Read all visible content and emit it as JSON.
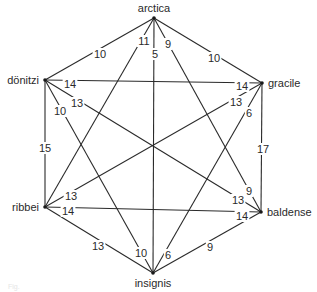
{
  "diagram": {
    "type": "complete-weighted-graph",
    "nodes": [
      {
        "id": "arctica",
        "label": "arctica",
        "x": 154,
        "y": 18,
        "lx": 154,
        "ly": 12,
        "anchor": "middle"
      },
      {
        "id": "gracile",
        "label": "gracile",
        "x": 262,
        "y": 83,
        "lx": 268,
        "ly": 87,
        "anchor": "start"
      },
      {
        "id": "baldense",
        "label": "baldense",
        "x": 261,
        "y": 212,
        "lx": 267,
        "ly": 216,
        "anchor": "start"
      },
      {
        "id": "insignis",
        "label": "insignis",
        "x": 153,
        "y": 273,
        "lx": 153,
        "ly": 287,
        "anchor": "middle"
      },
      {
        "id": "ribbei",
        "label": "ribbei",
        "x": 45,
        "y": 207,
        "lx": 39,
        "ly": 211,
        "anchor": "end"
      },
      {
        "id": "donitzi",
        "label": "dönitzi",
        "x": 45,
        "y": 80,
        "lx": 39,
        "ly": 84,
        "anchor": "end"
      }
    ],
    "edges": [
      {
        "from": "arctica",
        "to": "donitzi",
        "weight": "10",
        "lx": 100,
        "ly": 54
      },
      {
        "from": "arctica",
        "to": "gracile",
        "weight": "10",
        "lx": 214,
        "ly": 58
      },
      {
        "from": "arctica",
        "to": "ribbei",
        "weight": "11",
        "lx": 144,
        "ly": 41
      },
      {
        "from": "arctica",
        "to": "insignis",
        "weight": "5",
        "lx": 155,
        "ly": 54
      },
      {
        "from": "arctica",
        "to": "baldense",
        "weight": "9",
        "lx": 168,
        "ly": 44
      },
      {
        "from": "donitzi",
        "to": "gracile",
        "weight": "14",
        "lx": 70,
        "ly": 84,
        "lx2": 242,
        "ly2": 86,
        "weight2": "14"
      },
      {
        "from": "donitzi",
        "to": "baldense",
        "weight": "13",
        "lx": 77,
        "ly": 103,
        "lx2": 238,
        "ly2": 200,
        "weight2": "13"
      },
      {
        "from": "donitzi",
        "to": "insignis",
        "weight": "10",
        "lx": 60,
        "ly": 111,
        "lx2": 141,
        "ly2": 253,
        "weight2": "10"
      },
      {
        "from": "donitzi",
        "to": "ribbei",
        "weight": "15",
        "lx": 45,
        "ly": 148
      },
      {
        "from": "gracile",
        "to": "ribbei",
        "weight": "13",
        "lx": 236,
        "ly": 102,
        "lx2": 71,
        "ly2": 196,
        "weight2": "13"
      },
      {
        "from": "gracile",
        "to": "insignis",
        "weight": "6",
        "lx": 249,
        "ly": 113,
        "lx2": 168,
        "ly2": 255,
        "weight2": "6"
      },
      {
        "from": "gracile",
        "to": "baldense",
        "weight": "17",
        "lx": 263,
        "ly": 149
      },
      {
        "from": "ribbei",
        "to": "baldense",
        "weight": "14",
        "lx": 68,
        "ly": 211,
        "lx2": 242,
        "ly2": 216,
        "weight2": "14"
      },
      {
        "from": "ribbei",
        "to": "insignis",
        "weight": "13",
        "lx": 98,
        "ly": 246
      },
      {
        "from": "baldense",
        "to": "insignis",
        "weight": "9",
        "lx": 210,
        "ly": 247
      },
      {
        "from": "arctica",
        "to": "baldense",
        "weight": "9",
        "lx": 249,
        "ly": 191,
        "secondary": true
      }
    ],
    "caption": "Fig."
  }
}
